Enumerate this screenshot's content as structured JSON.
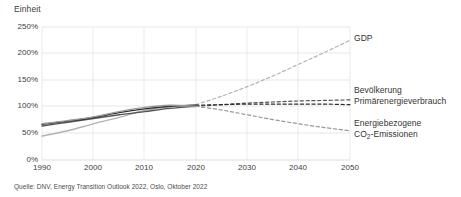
{
  "chart_data": {
    "type": "line",
    "title": "",
    "ylabel": "Einheit",
    "xlabel": "",
    "ylim": [
      0,
      250
    ],
    "xlim": [
      1990,
      2050
    ],
    "grid": true,
    "legend_position": "right-inline",
    "yticks": [
      "250%",
      "200%",
      "150%",
      "100%",
      "50%",
      "0%"
    ],
    "ytick_values": [
      250,
      200,
      150,
      100,
      50,
      0
    ],
    "xticks": [
      "1990",
      "2000",
      "2010",
      "2020",
      "2030",
      "2040",
      "2050"
    ],
    "xtick_values": [
      1990,
      2000,
      2010,
      2020,
      2030,
      2040,
      2050
    ],
    "history_forecast_split": 2020,
    "x": [
      1990,
      1995,
      2000,
      2005,
      2010,
      2015,
      2020,
      2025,
      2030,
      2035,
      2040,
      2045,
      2050
    ],
    "series": [
      {
        "name": "GDP",
        "label": "GDP",
        "color": "#b3b3b3",
        "values": [
          45,
          55,
          68,
          80,
          93,
          100,
          104,
          120,
          138,
          158,
          180,
          202,
          225
        ]
      },
      {
        "name": "Bevoelkerung",
        "label": "Bevölkerung",
        "color": "#555555",
        "values": [
          64,
          71,
          78,
          85,
          91,
          97,
          101,
          104,
          107,
          109,
          111,
          112,
          113
        ]
      },
      {
        "name": "Primaerenergieverbrauch",
        "label": "Primärenergieverbrauch",
        "color": "#2e2e2e",
        "values": [
          67,
          73,
          80,
          89,
          96,
          101,
          103,
          104,
          105,
          105,
          105,
          105,
          104
        ]
      },
      {
        "name": "Energiebezogene CO2-Emissionen",
        "label_line1": "Energiebezogene",
        "label_line2_pre": "CO",
        "label_line2_sub": "2",
        "label_line2_post": "-Emissionen",
        "color": "#999999",
        "values": [
          68,
          74,
          81,
          91,
          99,
          103,
          101,
          94,
          85,
          76,
          68,
          61,
          55
        ]
      }
    ]
  },
  "source": {
    "note": "Quelle: DNV, Energy Transition Outlook 2022, Oslo, Oktober 2022"
  }
}
